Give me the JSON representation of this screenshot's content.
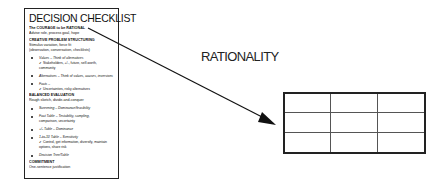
{
  "checklist": {
    "title": "DECISION CHECKLIST",
    "courage_head": "The COURAGE to be RATIONAL",
    "courage_sub": "Advise role, process goal, hope",
    "creative_head": "CREATIVE PROBLEM STRUCTURING",
    "creative_sub1": "Stimulus variation, force fit",
    "creative_sub2": "(observation, conversation, checklists)",
    "values": "Values – Think of alternatives",
    "values_check1": "✔ Stakeholders, +/-, future, self-worth,",
    "values_check2": "community",
    "alternatives": "Alternatives – Think of values, causes, inversions",
    "facts": "Facts –",
    "facts_check": "✔ Uncertainties, risky alternatives",
    "balanced_head": "BALANCED EVALUATION",
    "balanced_sub": "Rough sketch, divide-and-conquer",
    "screening": "Screening – Dominance/feasibility",
    "fact_table1": "Fact Table – Testability, sampling,",
    "fact_table2": "comparison, uncertainty",
    "plusminus": "+/- Table – Dominance",
    "one_to_ten": "1-to-10 Table – Sensitivity",
    "control_check1": "✔ Control, get information, diversify, maintain",
    "control_check2": "options, share risk",
    "decision_tree": "Decision Tree/Table",
    "commitment_head": "COMMITMENT",
    "commitment_sub": "One-sentence justification"
  },
  "label": "RATIONALITY",
  "grid": {
    "rows": 3,
    "columns": 3
  }
}
